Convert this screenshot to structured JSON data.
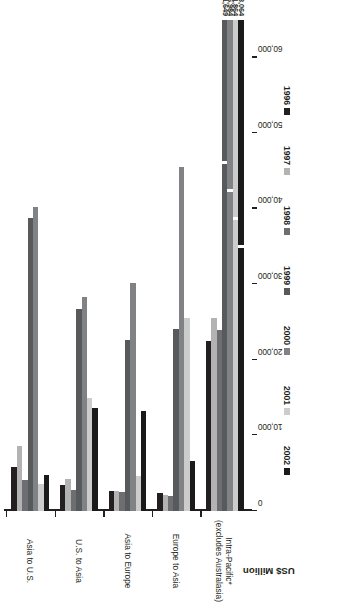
{
  "chart_data": {
    "type": "bar",
    "orientation": "horizontal",
    "title": "",
    "xlabel": "US$ Million",
    "ylabel": "",
    "xlim": [
      0,
      65000
    ],
    "grid": false,
    "legend_position": "bottom",
    "axis_title": "US$ Million",
    "tick_labels": [
      "0",
      "10,000",
      "20,000",
      "30,000",
      "40,000",
      "50,000",
      "60,000"
    ],
    "tick_values": [
      0,
      10000,
      20000,
      30000,
      40000,
      50000,
      60000
    ],
    "categories": [
      "Asia to U.S.",
      "U.S. to Asia",
      "Asia to Europe",
      "Europe to Asia",
      "Intra-Pacific*"
    ],
    "category_sublabels": [
      "",
      "",
      "",
      "",
      "(excludes Australasia)"
    ],
    "series": [
      {
        "name": "1996",
        "color": "#231f20",
        "values": [
          5800,
          3500,
          2600,
          2400,
          22500
        ]
      },
      {
        "name": "1997",
        "color": "#b3b3b3",
        "values": [
          8600,
          4200,
          2700,
          2100,
          25500
        ]
      },
      {
        "name": "1998",
        "color": "#6d6e71",
        "values": [
          4100,
          2800,
          2500,
          2000,
          24000
        ]
      },
      {
        "name": "1999",
        "color": "#58595b",
        "values": [
          38800,
          26700,
          22600,
          24100,
          81649
        ]
      },
      {
        "name": "2000",
        "color": "#808285",
        "values": [
          40200,
          28300,
          30200,
          45600,
          186984
        ]
      },
      {
        "name": "2001",
        "color": "#cccccc",
        "values": [
          3600,
          14900,
          4600,
          25600,
          151864
        ]
      },
      {
        "name": "2002",
        "color": "#1a1a1a",
        "values": [
          4800,
          13700,
          13300,
          6600,
          123064
        ]
      }
    ],
    "data_labels": [
      {
        "series": "1999",
        "category": "Intra-Pacific*",
        "text": "81,649"
      },
      {
        "series": "2000",
        "category": "Intra-Pacific*",
        "text": "186,984"
      },
      {
        "series": "2001",
        "category": "Intra-Pacific*",
        "text": "151,864"
      },
      {
        "series": "2002",
        "category": "Intra-Pacific*",
        "text": "123,064"
      }
    ],
    "footnote": ""
  },
  "legend": {
    "items": [
      {
        "label": "1996",
        "color": "#231f20"
      },
      {
        "label": "1997",
        "color": "#b3b3b3"
      },
      {
        "label": "1998",
        "color": "#6d6e71"
      },
      {
        "label": "1999",
        "color": "#58595b"
      },
      {
        "label": "2000",
        "color": "#808285"
      },
      {
        "label": "2001",
        "color": "#cccccc"
      },
      {
        "label": "2002",
        "color": "#1a1a1a"
      }
    ]
  },
  "axis": {
    "value_axis_title": "US$ Million",
    "ticks": [
      "0",
      "10,000",
      "20,000",
      "30,000",
      "40,000",
      "50,000",
      "60,000"
    ]
  },
  "categories": [
    {
      "label": "Asia to U.S.",
      "sublabel": ""
    },
    {
      "label": "U.S. to Asia",
      "sublabel": ""
    },
    {
      "label": "Asia to Europe",
      "sublabel": ""
    },
    {
      "label": "Europe to Asia",
      "sublabel": ""
    },
    {
      "label": "Intra-Pacific*",
      "sublabel": "(excludes Australasia)"
    }
  ],
  "bar_labels": {
    "intra_1999": "81,649",
    "intra_2000": "186,984",
    "intra_2001": "151,864",
    "intra_2002": "123,064"
  }
}
